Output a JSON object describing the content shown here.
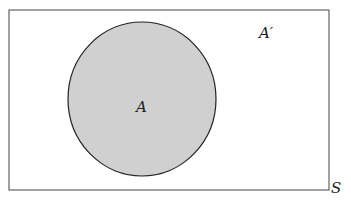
{
  "diagram": {
    "type": "venn",
    "universe": {
      "label": "S"
    },
    "sets": [
      {
        "label": "A",
        "fill": "#d0d0d0",
        "stroke": "#222222"
      }
    ],
    "complement": {
      "label": "A′"
    },
    "colors": {
      "background": "#ffffff",
      "shaded": "#d0d0d0",
      "outline": "#333333"
    }
  }
}
